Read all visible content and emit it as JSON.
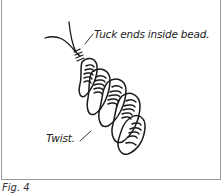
{
  "figure": {
    "caption": "Fig. 4",
    "annotations": {
      "tuck": "Tuck ends inside bead.",
      "twist": "Twist."
    },
    "colors": {
      "line": "#1a1a1a",
      "frame": "#9a9a9a",
      "background": "#ffffff"
    }
  }
}
